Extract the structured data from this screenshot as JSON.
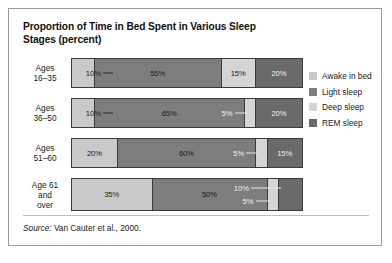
{
  "figure": {
    "title": "Proportion of Time in Bed Spent in Various Sleep Stages (percent)",
    "source_word": "Source:",
    "source_text": " Van Cauter et al., 2000."
  },
  "legend": {
    "items": [
      {
        "label": "Awake in bed",
        "color": "#c9c9c9"
      },
      {
        "label": "Light sleep",
        "color": "#7d7d7d"
      },
      {
        "label": "Deep sleep",
        "color": "#d5d5d5"
      },
      {
        "label": "REM sleep",
        "color": "#6a6a6a"
      }
    ]
  },
  "chart_data": {
    "type": "bar",
    "orientation": "horizontal",
    "stacked": true,
    "title": "Proportion of Time in Bed Spent in Various Sleep Stages (percent)",
    "xlabel": "",
    "ylabel": "",
    "xlim": [
      0,
      100
    ],
    "grid": false,
    "legend_position": "right",
    "categories": [
      "Ages 16–35",
      "Ages 36–50",
      "Ages 51–60",
      "Age 61 and over"
    ],
    "series": [
      {
        "name": "Awake in bed",
        "color": "#c9c9c9",
        "values": [
          10,
          10,
          20,
          35
        ]
      },
      {
        "name": "Light sleep",
        "color": "#7d7d7d",
        "values": [
          55,
          65,
          60,
          50
        ]
      },
      {
        "name": "Deep sleep",
        "color": "#d5d5d5",
        "values": [
          15,
          5,
          5,
          5
        ]
      },
      {
        "name": "REM sleep",
        "color": "#6a6a6a",
        "values": [
          20,
          20,
          15,
          10
        ]
      }
    ],
    "annotations": [
      "10%",
      "55%",
      "15%",
      "20%",
      "10%",
      "65%",
      "5%",
      "20%",
      "20%",
      "60%",
      "5%",
      "15%",
      "35%",
      "50%",
      "5%",
      "10%"
    ]
  },
  "rows": [
    {
      "label_line1": "Ages",
      "label_line2": "16–35",
      "segments": [
        {
          "stage": "Awake in bed",
          "value": 10,
          "label": "10%",
          "color": "#c9c9c9",
          "label_mode": "callout-right",
          "label_tone": "dark",
          "lead": 10
        },
        {
          "stage": "Light sleep",
          "value": 55,
          "label": "55%",
          "color": "#7d7d7d",
          "label_mode": "inside",
          "label_tone": "dark"
        },
        {
          "stage": "Deep sleep",
          "value": 15,
          "label": "15%",
          "color": "#d5d5d5",
          "label_mode": "inside",
          "label_tone": "dark"
        },
        {
          "stage": "REM sleep",
          "value": 20,
          "label": "20%",
          "color": "#6a6a6a",
          "label_mode": "inside",
          "label_tone": "light"
        }
      ]
    },
    {
      "label_line1": "Ages",
      "label_line2": "36–50",
      "segments": [
        {
          "stage": "Awake in bed",
          "value": 10,
          "label": "10%",
          "color": "#c9c9c9",
          "label_mode": "callout-right",
          "label_tone": "dark",
          "lead": 10
        },
        {
          "stage": "Light sleep",
          "value": 65,
          "label": "65%",
          "color": "#7d7d7d",
          "label_mode": "inside",
          "label_tone": "dark"
        },
        {
          "stage": "Deep sleep",
          "value": 5,
          "label": "5%",
          "color": "#d5d5d5",
          "label_mode": "callout-left",
          "label_tone": "light",
          "lead": 12
        },
        {
          "stage": "REM sleep",
          "value": 20,
          "label": "20%",
          "color": "#6a6a6a",
          "label_mode": "inside",
          "label_tone": "light"
        }
      ]
    },
    {
      "label_line1": "Ages",
      "label_line2": "51–60",
      "segments": [
        {
          "stage": "Awake in bed",
          "value": 20,
          "label": "20%",
          "color": "#c9c9c9",
          "label_mode": "inside",
          "label_tone": "dark"
        },
        {
          "stage": "Light sleep",
          "value": 60,
          "label": "60%",
          "color": "#7d7d7d",
          "label_mode": "inside",
          "label_tone": "dark"
        },
        {
          "stage": "Deep sleep",
          "value": 5,
          "label": "5%",
          "color": "#d5d5d5",
          "label_mode": "callout-left",
          "label_tone": "light",
          "lead": 12
        },
        {
          "stage": "REM sleep",
          "value": 15,
          "label": "15%",
          "color": "#6a6a6a",
          "label_mode": "inside",
          "label_tone": "light"
        }
      ]
    },
    {
      "label_line1": "Age 61",
      "label_line2": "and",
      "label_line3": "over",
      "segments": [
        {
          "stage": "Awake in bed",
          "value": 35,
          "label": "35%",
          "color": "#c9c9c9",
          "label_mode": "inside",
          "label_tone": "dark"
        },
        {
          "stage": "Light sleep",
          "value": 50,
          "label": "50%",
          "color": "#7d7d7d",
          "label_mode": "inside",
          "label_tone": "dark"
        },
        {
          "stage": "Deep sleep",
          "value": 5,
          "label": "5%",
          "color": "#d5d5d5",
          "label_mode": "callout-left-low",
          "label_tone": "light",
          "lead": 14
        },
        {
          "stage": "REM sleep",
          "value": 10,
          "label": "10%",
          "color": "#6a6a6a",
          "label_mode": "callout-left-high",
          "label_tone": "light",
          "lead": 30
        }
      ]
    }
  ]
}
